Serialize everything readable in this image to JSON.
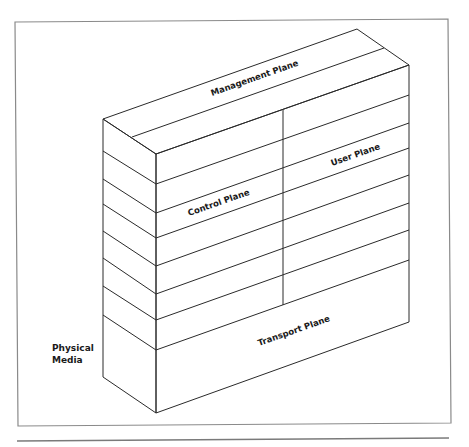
{
  "diagram": {
    "type": "isometric layered block model",
    "labels": {
      "management_plane": "Management Plane",
      "control_plane": "Control Plane",
      "user_plane": "User Plane",
      "transport_plane": "Transport Plane",
      "physical_media_line1": "Physical",
      "physical_media_line2": "Media"
    },
    "layers": {
      "front_face_left_x": 156,
      "front_face_right_x": 409,
      "back_left_x": 103,
      "front_lines_left_y": [
        154,
        184,
        213,
        238,
        266,
        294,
        320,
        350,
        413
      ],
      "front_lines_right_y": [
        65,
        95,
        123,
        148,
        175,
        203,
        230,
        260,
        322
      ],
      "side_lines_back_y": [
        119,
        151,
        179,
        204,
        231,
        258,
        286,
        315,
        377
      ]
    },
    "colors": {
      "line": "#2a2a2a",
      "frame": "#8a8a8a",
      "background": "#ffffff"
    }
  }
}
